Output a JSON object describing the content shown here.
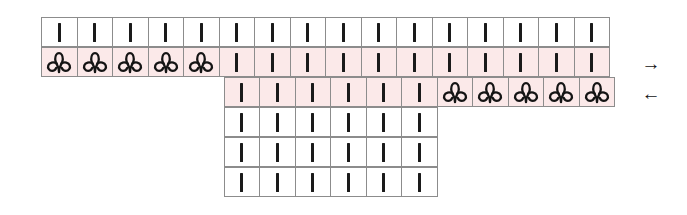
{
  "chart": {
    "symbol_legend": {
      "knit": "vertical-bar",
      "twisted": "twisted-stitch-loop"
    },
    "colors": {
      "highlight": "#fbe9e9",
      "grid_line": "#8c8c8c",
      "symbol": "#1a1a1a",
      "background": "#ffffff"
    },
    "geometry": {
      "columns": 16,
      "rows": 6,
      "cell_width": 36.5,
      "cell_height": 30,
      "origin_x": 42,
      "origin_y": 18
    },
    "rows": [
      {
        "index": 1,
        "start_column": 1,
        "highlighted": false,
        "arrow": "",
        "cells": [
          "knit",
          "knit",
          "knit",
          "knit",
          "knit",
          "knit",
          "knit",
          "knit",
          "knit",
          "knit",
          "knit",
          "knit",
          "knit",
          "knit",
          "knit",
          "knit"
        ]
      },
      {
        "index": 2,
        "start_column": 1,
        "highlighted": true,
        "arrow": "→",
        "arrow_name": "arrow-right",
        "cells": [
          "twisted",
          "twisted",
          "twisted",
          "twisted",
          "twisted",
          "knit",
          "knit",
          "knit",
          "knit",
          "knit",
          "knit",
          "knit",
          "knit",
          "knit",
          "knit",
          "knit"
        ]
      },
      {
        "index": 3,
        "start_column": 6,
        "highlighted": true,
        "arrow": "←",
        "arrow_name": "arrow-left",
        "cells": [
          "knit",
          "knit",
          "knit",
          "knit",
          "knit",
          "knit",
          "twisted",
          "twisted",
          "twisted",
          "twisted",
          "twisted"
        ]
      },
      {
        "index": 4,
        "start_column": 6,
        "highlighted": false,
        "arrow": "",
        "cells": [
          "knit",
          "knit",
          "knit",
          "knit",
          "knit",
          "knit"
        ]
      },
      {
        "index": 5,
        "start_column": 6,
        "highlighted": false,
        "arrow": "",
        "cells": [
          "knit",
          "knit",
          "knit",
          "knit",
          "knit",
          "knit"
        ]
      },
      {
        "index": 6,
        "start_column": 6,
        "highlighted": false,
        "arrow": "",
        "cells": [
          "knit",
          "knit",
          "knit",
          "knit",
          "knit",
          "knit"
        ]
      }
    ]
  }
}
